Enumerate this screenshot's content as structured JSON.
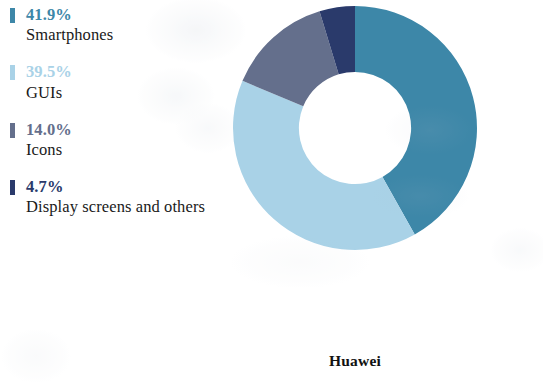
{
  "figure": {
    "caption": "Huawei",
    "background_color": "#ffffff"
  },
  "legend": {
    "items": [
      {
        "percent": "41.9%",
        "label": "Smartphones",
        "color": "#3d87a8"
      },
      {
        "percent": "39.5%",
        "label": "GUIs",
        "color": "#a9d2e7"
      },
      {
        "percent": "14.0%",
        "label": "Icons",
        "color": "#646f8c"
      },
      {
        "percent": "4.7%",
        "label": "Display screens and others",
        "color": "#2a3a6b"
      }
    ]
  },
  "chart_data": {
    "type": "pie",
    "variant": "donut",
    "title": "Huawei",
    "subtitle": "",
    "xlabel": "",
    "ylabel": "",
    "categories": [
      "Smartphones",
      "GUIs",
      "Icons",
      "Display screens and others"
    ],
    "values": [
      41.9,
      39.5,
      14.0,
      4.7
    ],
    "value_labels": [
      "41.9%",
      "39.5%",
      "14.0%",
      "4.7%"
    ],
    "units": "percent",
    "total": 100.1,
    "colors": [
      "#3d87a8",
      "#a9d2e7",
      "#646f8c",
      "#2a3a6b"
    ],
    "start_angle_deg": 0,
    "direction": "clockwise",
    "inner_radius_ratio": 0.46,
    "legend_position": "left",
    "grid": false,
    "data_labels_on_slices": false
  }
}
